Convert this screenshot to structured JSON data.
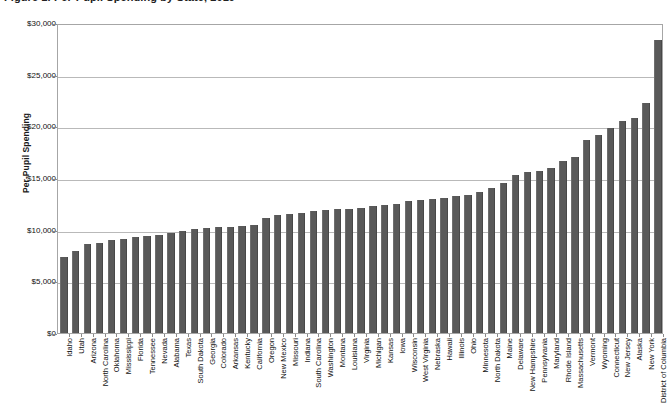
{
  "figure": {
    "title": "Figure 1. Per-Pupil Spending by State, 2019"
  },
  "chart_data": {
    "type": "bar",
    "title": "Figure 1. Per-Pupil Spending by State, 2019",
    "xlabel": "",
    "ylabel": "Per-Pupil Spending",
    "ylim": [
      0,
      30000
    ],
    "ytick_labels": [
      "$30,000",
      "$25,000",
      "$20,000",
      "$15,000",
      "$10,000",
      "$5,000",
      "$0"
    ],
    "ytick_values": [
      30000,
      25000,
      20000,
      15000,
      10000,
      5000,
      0
    ],
    "grid": true,
    "legend": "none",
    "bar_color": "#595959",
    "categories": [
      "Idaho",
      "Utah",
      "Arizona",
      "North Carolina",
      "Oklahoma",
      "Mississippi",
      "Florida",
      "Tennessee",
      "Nevada",
      "Alabama",
      "Texas",
      "South Dakota",
      "Georgia",
      "Colorado",
      "Arkansas",
      "Kentucky",
      "California",
      "Oregon",
      "New Mexico",
      "Missouri",
      "Indiana",
      "South Carolina",
      "Washington",
      "Montana",
      "Louisiana",
      "Virginia",
      "Michigan",
      "Kansas",
      "Iowa",
      "Wisconsin",
      "West Virginia",
      "Nebraska",
      "Hawaii",
      "Illinois",
      "Ohio",
      "Minnesota",
      "North Dakota",
      "Maine",
      "Delaware",
      "New Hampshire",
      "Pennsylvania",
      "Maryland",
      "Rhode Island",
      "Massachusetts",
      "Vermont",
      "Wyoming",
      "Connecticut",
      "New Jersey",
      "Alaska",
      "New York",
      "District of Columbia"
    ],
    "values": [
      7400,
      7900,
      8600,
      8700,
      9000,
      9100,
      9300,
      9400,
      9500,
      9700,
      9900,
      10100,
      10200,
      10300,
      10300,
      10400,
      10500,
      11100,
      11400,
      11500,
      11600,
      11800,
      11900,
      12000,
      12000,
      12100,
      12300,
      12400,
      12500,
      12800,
      12900,
      13000,
      13100,
      13300,
      13400,
      13600,
      14000,
      14500,
      15300,
      15600,
      15700,
      16000,
      16600,
      17000,
      18700,
      19200,
      19800,
      20500,
      20800,
      22300,
      28400
    ]
  }
}
